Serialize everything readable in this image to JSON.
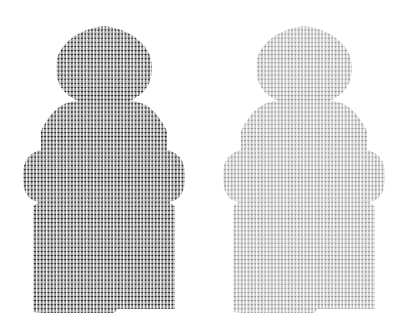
{
  "canvas": {
    "width": 399,
    "height": 334,
    "background_color": "#ffffff"
  },
  "artwork": {
    "type": "halftone-silhouette-pair",
    "subject_name": "hooded-figure-silhouette",
    "subject_description": "hooded poncho / raincoat figure seen from front, head and wide-shouldered body with sleeve bumps and straight hem",
    "count": 2,
    "arrangement": "side-by-side",
    "fill_style": "repeating micro-glyph texture",
    "glyph_name": "tiny-person-glyph",
    "glyph_pitch_x": 3.35,
    "glyph_pitch_y": 4.1
  },
  "figures": [
    {
      "id": "figure-left",
      "label": "dark hooded figure",
      "glyph_color": "#1b1b1b",
      "tone": "dark",
      "offset_x": 0,
      "bounds": {
        "x": 22,
        "y": 26,
        "width": 165,
        "height": 288
      }
    },
    {
      "id": "figure-right",
      "label": "light gray hooded figure",
      "glyph_color": "#919191",
      "tone": "light",
      "offset_x": 200,
      "bounds": {
        "x": 222,
        "y": 26,
        "width": 165,
        "height": 288
      }
    }
  ],
  "silhouette_path": {
    "description": "outline of the hooded figure used as a clip for the glyph texture",
    "hood_apex_y": 26,
    "hood_widest_y": 65,
    "neck_y": 101,
    "shoulder_start_y": 105,
    "sleeve_bulge_top_y": 152,
    "sleeve_bulge_bottom_y": 202,
    "skirt_top_y": 206,
    "hem_y": 313,
    "center_x": 104,
    "hood_half_width": 48,
    "neck_half_width": 26,
    "shoulder_half_width": 63,
    "sleeve_half_width": 81,
    "skirt_half_width": 71
  }
}
